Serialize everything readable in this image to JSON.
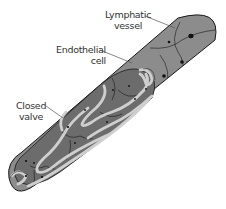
{
  "figure": {
    "type": "labeled-anatomical-diagram",
    "colors": {
      "background": "#ffffff",
      "vessel_outer": "#8c8c8c",
      "vessel_inner": "#6c6c6c",
      "valve": "#cfcfcf",
      "outline": "#1a1a1a",
      "nucleus": "#111111",
      "label_text": "#333333",
      "leader_line": "#555555"
    },
    "labels": [
      {
        "id": "lymphatic-vessel",
        "line1": "Lymphatic",
        "line2": "vessel"
      },
      {
        "id": "endothelial-cell",
        "line1": "Endothelial",
        "line2": "cell"
      },
      {
        "id": "closed-valve",
        "line1": "Closed",
        "line2": "valve"
      }
    ]
  }
}
